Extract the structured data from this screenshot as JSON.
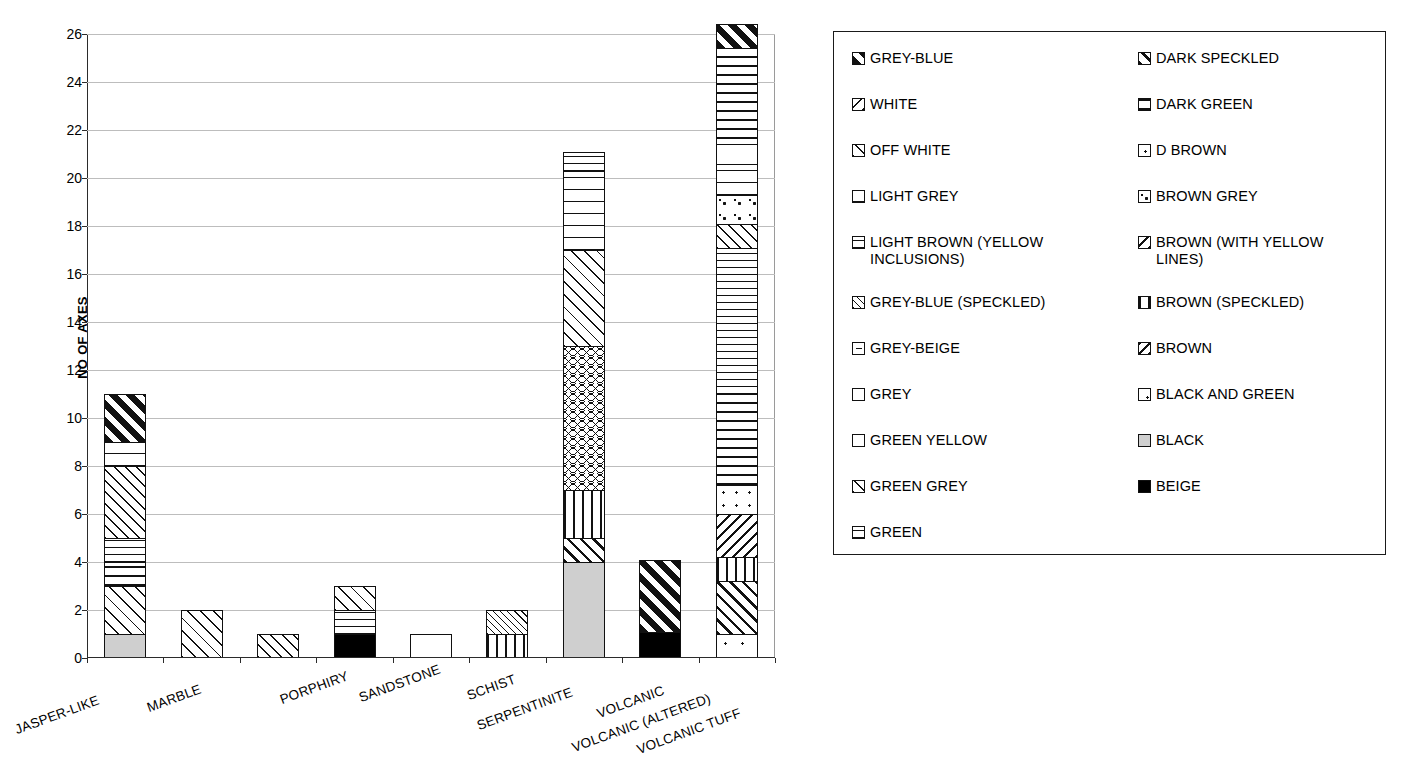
{
  "chart_data": {
    "type": "bar",
    "subtype": "stacked",
    "title": "",
    "xlabel": "",
    "ylabel": "NO OF AXES",
    "ylim": [
      0,
      26
    ],
    "ytick_step": 2,
    "yticks": [
      0,
      2,
      4,
      6,
      8,
      10,
      12,
      14,
      16,
      18,
      20,
      22,
      24,
      26
    ],
    "grid": true,
    "legend_position": "right",
    "categories": [
      "JASPER-LIKE",
      "MARBLE",
      "PORPHIRY",
      "SANDSTONE",
      "SCHIST",
      "SERPENTINITE",
      "VOLCANIC",
      "VOLCANIC (ALTERED)",
      "VOLCANIC TUFF"
    ],
    "totals": [
      11,
      2,
      1,
      3,
      1,
      2,
      21.1,
      4.1,
      26.1
    ],
    "series": [
      {
        "name": "GREY-BLUE",
        "pattern": "p-greyblue",
        "values": [
          2,
          0,
          0,
          0,
          0,
          0,
          0,
          3,
          1
        ]
      },
      {
        "name": "WHITE",
        "pattern": "p-white",
        "values": [
          0,
          0,
          0,
          0,
          0,
          0,
          0,
          0,
          0
        ]
      },
      {
        "name": "OFF WHITE",
        "pattern": "p-offwhite",
        "values": [
          2,
          2,
          0,
          1,
          0,
          0,
          4,
          0,
          0
        ]
      },
      {
        "name": "LIGHT GREY",
        "pattern": "p-lightgrey",
        "values": [
          1,
          0,
          0,
          0,
          0,
          0,
          3.3,
          0,
          1.3
        ]
      },
      {
        "name": "LIGHT BROWN (YELLOW INCLUSIONS)",
        "pattern": "p-lightbrown",
        "values": [
          0,
          0,
          0,
          0,
          0,
          0,
          0.8,
          0,
          4
        ]
      },
      {
        "name": "GREY-BLUE (SPECKLED)",
        "pattern": "p-greyblue-sp",
        "values": [
          0,
          0,
          0,
          0,
          0,
          1,
          0,
          0,
          0
        ]
      },
      {
        "name": "GREY-BEIGE",
        "pattern": "p-greybeige",
        "values": [
          0,
          0,
          0,
          0,
          1,
          0,
          0,
          0,
          0.8
        ]
      },
      {
        "name": "GREY",
        "pattern": "p-grey",
        "values": [
          0,
          0,
          0,
          0,
          0,
          0,
          0,
          0,
          0
        ]
      },
      {
        "name": "GREEN YELLOW",
        "pattern": "p-greenyellow",
        "values": [
          0,
          0,
          0,
          0,
          0,
          0,
          0,
          0,
          0
        ]
      },
      {
        "name": "GREEN GREY",
        "pattern": "p-greengrey",
        "values": [
          3,
          0,
          1,
          0,
          0,
          0,
          0,
          0,
          1
        ]
      },
      {
        "name": "GREEN",
        "pattern": "p-green",
        "values": [
          1,
          0,
          0,
          1,
          0,
          0,
          0,
          0,
          6.1
        ]
      },
      {
        "name": "DARK SPECKLED",
        "pattern": "p-darkspeckled",
        "values": [
          0,
          0,
          0,
          0,
          0,
          0,
          1,
          0,
          2.2
        ]
      },
      {
        "name": "DARK GREEN",
        "pattern": "p-darkgreen",
        "values": [
          1,
          0,
          0,
          0,
          0,
          0,
          0,
          0,
          3.8
        ]
      },
      {
        "name": "D BROWN",
        "pattern": "p-dbrown",
        "values": [
          0,
          0,
          0,
          0,
          0,
          0,
          0,
          0,
          1.2
        ]
      },
      {
        "name": "BROWN GREY",
        "pattern": "p-browngrey",
        "values": [
          0,
          0,
          0,
          0,
          0,
          0,
          0,
          0,
          1.2
        ]
      },
      {
        "name": "BROWN (WITH YELLOW LINES)",
        "pattern": "p-brownyellow",
        "values": [
          0,
          0,
          0,
          0,
          0,
          0,
          6,
          0,
          1.8
        ]
      },
      {
        "name": "BROWN (SPECKLED)",
        "pattern": "p-brownspeckled",
        "values": [
          0,
          0,
          0,
          0,
          0,
          1,
          2,
          0,
          1
        ]
      },
      {
        "name": "BROWN",
        "pattern": "p-brown",
        "values": [
          0,
          0,
          0,
          0,
          0,
          0,
          0,
          0,
          0
        ]
      },
      {
        "name": "BLACK AND GREEN",
        "pattern": "p-blackgreen",
        "values": [
          0,
          0,
          0,
          0,
          0,
          0,
          0,
          0,
          1
        ]
      },
      {
        "name": "BLACK",
        "pattern": "p-black",
        "values": [
          1,
          0,
          0,
          0,
          0,
          0,
          4,
          0,
          0
        ]
      },
      {
        "name": "BEIGE",
        "pattern": "p-beige",
        "values": [
          0,
          0,
          0,
          1,
          0,
          0,
          0,
          1.1,
          0
        ]
      }
    ],
    "stacks": [
      {
        "category": "JASPER-LIKE",
        "segments": [
          {
            "name": "BLACK",
            "pattern": "p-black",
            "value": 1
          },
          {
            "name": "OFF WHITE",
            "pattern": "p-offwhite",
            "value": 2
          },
          {
            "name": "DARK GREEN",
            "pattern": "p-darkgreen",
            "value": 1
          },
          {
            "name": "GREEN",
            "pattern": "p-green",
            "value": 1
          },
          {
            "name": "GREEN GREY",
            "pattern": "p-greengrey",
            "value": 3
          },
          {
            "name": "LIGHT GREY",
            "pattern": "p-lightgrey",
            "value": 1
          },
          {
            "name": "GREY-BLUE",
            "pattern": "p-greyblue",
            "value": 2
          }
        ]
      },
      {
        "category": "MARBLE",
        "segments": [
          {
            "name": "OFF WHITE",
            "pattern": "p-offwhite",
            "value": 2
          }
        ]
      },
      {
        "category": "PORPHIRY",
        "segments": [
          {
            "name": "GREEN GREY",
            "pattern": "p-greengrey",
            "value": 1
          }
        ]
      },
      {
        "category": "SANDSTONE",
        "segments": [
          {
            "name": "BEIGE",
            "pattern": "p-beige",
            "value": 1
          },
          {
            "name": "GREEN",
            "pattern": "p-green",
            "value": 1
          },
          {
            "name": "OFF WHITE",
            "pattern": "p-offwhite",
            "value": 1
          }
        ]
      },
      {
        "category": "SCHIST",
        "segments": [
          {
            "name": "GREY-BEIGE",
            "pattern": "p-greybeige",
            "value": 1
          }
        ]
      },
      {
        "category": "SERPENTINITE",
        "segments": [
          {
            "name": "BROWN (SPECKLED)",
            "pattern": "p-brownspeckled",
            "value": 1
          },
          {
            "name": "GREY-BLUE (SPECKLED)",
            "pattern": "p-greyblue-sp",
            "value": 1
          }
        ]
      },
      {
        "category": "VOLCANIC",
        "segments": [
          {
            "name": "BLACK",
            "pattern": "p-black",
            "value": 4
          },
          {
            "name": "DARK SPECKLED",
            "pattern": "p-darkspeckled",
            "value": 1
          },
          {
            "name": "BROWN (SPECKLED)",
            "pattern": "p-brownspeckled",
            "value": 2
          },
          {
            "name": "BROWN (WITH YELLOW LINES)",
            "pattern": "p-wave",
            "value": 6
          },
          {
            "name": "OFF WHITE",
            "pattern": "p-offwhite",
            "value": 4
          },
          {
            "name": "LIGHT GREY",
            "pattern": "p-lightgrey",
            "value": 3.3
          },
          {
            "name": "LIGHT BROWN (YELLOW INCLUSIONS)",
            "pattern": "p-lightbrown",
            "value": 0.8
          }
        ]
      },
      {
        "category": "VOLCANIC (ALTERED)",
        "segments": [
          {
            "name": "BEIGE",
            "pattern": "p-beige",
            "value": 1.1
          },
          {
            "name": "GREY-BLUE",
            "pattern": "p-greyblue",
            "value": 3
          }
        ]
      },
      {
        "category": "VOLCANIC TUFF",
        "segments": [
          {
            "name": "BLACK AND GREEN",
            "pattern": "p-blackgreen",
            "value": 1
          },
          {
            "name": "DARK SPECKLED",
            "pattern": "p-darkspeckled",
            "value": 2.2
          },
          {
            "name": "BROWN (SPECKLED)",
            "pattern": "p-brownspeckled",
            "value": 1
          },
          {
            "name": "BROWN (WITH YELLOW LINES)",
            "pattern": "p-brownyellow",
            "value": 1.8
          },
          {
            "name": "D BROWN",
            "pattern": "p-dbrown",
            "value": 1.2
          },
          {
            "name": "DARK GREEN",
            "pattern": "p-darkgreen",
            "value": 3.8
          },
          {
            "name": "GREEN",
            "pattern": "p-green",
            "value": 6.1
          },
          {
            "name": "GREEN GREY",
            "pattern": "p-greengrey",
            "value": 1
          },
          {
            "name": "BROWN GREY",
            "pattern": "p-browngrey",
            "value": 1.2
          },
          {
            "name": "LIGHT GREY",
            "pattern": "p-lightgrey",
            "value": 1.3
          },
          {
            "name": "GREY-BEIGE",
            "pattern": "p-greybeige",
            "value": 0.8
          },
          {
            "name": "LIGHT BROWN (YELLOW INCLUSIONS)",
            "pattern": "p-brick",
            "value": 4
          },
          {
            "name": "GREY-BLUE",
            "pattern": "p-greyblue",
            "value": 1
          }
        ]
      }
    ]
  },
  "legend": {
    "columns": [
      {
        "items": [
          {
            "label": "GREY-BLUE",
            "pattern": "p-greyblue"
          },
          {
            "label": "WHITE",
            "pattern": "p-white"
          },
          {
            "label": "OFF WHITE",
            "pattern": "p-offwhite"
          },
          {
            "label": "LIGHT GREY",
            "pattern": "p-lightgrey"
          },
          {
            "label": "LIGHT BROWN (YELLOW INCLUSIONS)",
            "pattern": "p-lightbrown"
          },
          {
            "label": "GREY-BLUE (SPECKLED)",
            "pattern": "p-greyblue-sp"
          },
          {
            "label": "GREY-BEIGE",
            "pattern": "p-greybeige"
          },
          {
            "label": "GREY",
            "pattern": "p-grey"
          },
          {
            "label": "GREEN YELLOW",
            "pattern": "p-greenyellow"
          },
          {
            "label": "GREEN GREY",
            "pattern": "p-greengrey"
          },
          {
            "label": "GREEN",
            "pattern": "p-green"
          }
        ]
      },
      {
        "items": [
          {
            "label": "DARK SPECKLED",
            "pattern": "p-darkspeckled"
          },
          {
            "label": "DARK GREEN",
            "pattern": "p-darkgreen"
          },
          {
            "label": "D BROWN",
            "pattern": "p-dbrown"
          },
          {
            "label": "BROWN GREY",
            "pattern": "p-browngrey"
          },
          {
            "label": "BROWN (WITH YELLOW LINES)",
            "pattern": "p-brownyellow"
          },
          {
            "label": "BROWN (SPECKLED)",
            "pattern": "p-brownspeckled"
          },
          {
            "label": "BROWN",
            "pattern": "p-brown"
          },
          {
            "label": "BLACK AND GREEN",
            "pattern": "p-blackgreen"
          },
          {
            "label": "BLACK",
            "pattern": "p-black"
          },
          {
            "label": "BEIGE",
            "pattern": "p-beige"
          }
        ]
      }
    ]
  },
  "colors": {
    "ink": "#111111",
    "grid": "#bdbdbd",
    "axis": "#2b2b2b",
    "black_swatch": "#cfcfcf",
    "beige_swatch": "#000000"
  }
}
